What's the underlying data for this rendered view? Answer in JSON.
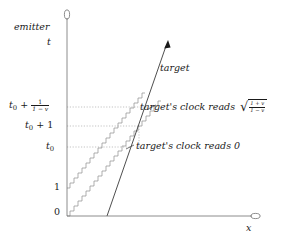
{
  "figure": {
    "title_hidden": "",
    "axes": {
      "y_axis_label": "t",
      "y_axis_caption": "emitter",
      "x_axis_label": "x",
      "y_axis_x_px": 67,
      "x_axis_y_px": 216
    },
    "tick_labels": [
      {
        "name": "tick-0",
        "text": "0",
        "y_px": 213
      },
      {
        "name": "tick-1",
        "text": "1",
        "y_px": 188
      },
      {
        "name": "tick-t0",
        "text_base": "t",
        "text_sub": "0",
        "y_px": 147
      },
      {
        "name": "tick-t0-plus-1",
        "text_base": "t",
        "text_sub": "0",
        "text_rest": "+ 1",
        "y_px": 126
      },
      {
        "name": "tick-t0-plus-frac",
        "text_base": "t",
        "text_sub": "0",
        "text_rest": "+",
        "frac_num": "1",
        "frac_den": "1 − v",
        "y_px": 107
      }
    ],
    "annotations": {
      "target_worldline_label": "target",
      "clock_reads_zero": "target's clock reads 0",
      "clock_reads_gamma_prefix": "target's clock reads",
      "clock_reads_gamma_num": "1 + v",
      "clock_reads_gamma_den": "1 − v",
      "radical_glyph": "√"
    },
    "colors": {
      "ink": "#1a1a1a",
      "axis": "#6e6e6e",
      "light_signal": "#8c8c8c",
      "guide": "#9a9a9a",
      "worldline": "#3a3a3a"
    },
    "geometry": {
      "staircase_lower_start": {
        "x": 67,
        "y": 216
      },
      "staircase_upper_start": {
        "x": 67,
        "y": 188
      },
      "worldline_start": {
        "x": 107,
        "y": 216
      },
      "worldline_tip": {
        "x": 168,
        "y": 40
      },
      "event_t0": {
        "x": 130,
        "y": 147
      },
      "event_t0_plus_frac": {
        "x": 152,
        "y": 107
      }
    }
  }
}
